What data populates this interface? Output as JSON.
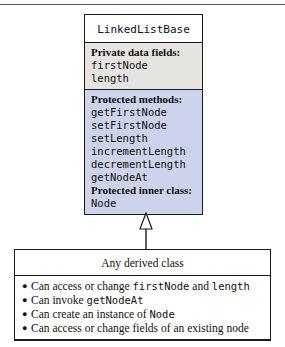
{
  "diagram": {
    "base_class": {
      "name": "LinkedListBase",
      "fields_heading": "Private data fields:",
      "fields": [
        "firstNode",
        "length"
      ],
      "methods_heading": "Protected methods:",
      "methods": [
        "getFirstNode",
        "setFirstNode",
        "setLength",
        "incrementLength",
        "decrementLength",
        "getNodeAt"
      ],
      "inner_class_heading": "Protected inner class:",
      "inner_classes": [
        "Node"
      ]
    },
    "derived_class": {
      "title": "Any derived class",
      "capabilities": [
        {
          "parts": [
            {
              "text": "Can access or change ",
              "style": "text"
            },
            {
              "text": "firstNode",
              "style": "code"
            },
            {
              "text": " and ",
              "style": "text"
            },
            {
              "text": "length",
              "style": "code"
            }
          ]
        },
        {
          "parts": [
            {
              "text": "Can invoke ",
              "style": "text"
            },
            {
              "text": "getNodeAt",
              "style": "code"
            }
          ]
        },
        {
          "parts": [
            {
              "text": "Can create an instance of ",
              "style": "text"
            },
            {
              "text": "Node",
              "style": "code"
            }
          ]
        },
        {
          "parts": [
            {
              "text": "Can access or change fields of an existing node",
              "style": "text"
            }
          ]
        }
      ],
      "bullet_glyph": "●"
    },
    "relationship": {
      "type": "generalization",
      "arrow": "hollow-triangle",
      "direction": "up"
    },
    "colors": {
      "fields_background": "#e5e4e0",
      "methods_background": "#ccd3ea",
      "box_background": "#ffffff",
      "border": "#1b1b1b",
      "text": "#111111"
    }
  }
}
